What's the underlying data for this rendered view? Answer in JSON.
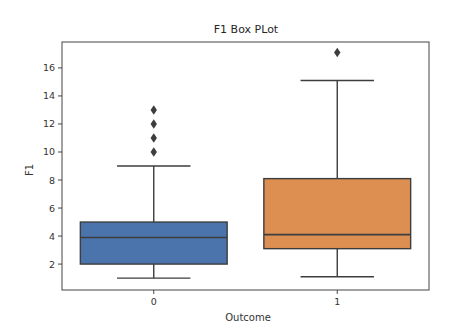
{
  "chart_data": {
    "type": "box",
    "title": "F1 Box PLot",
    "xlabel": "Outcome",
    "ylabel": "F1",
    "categories": [
      "0",
      "1"
    ],
    "ylim": [
      0.15,
      17.85
    ],
    "yticks": [
      2,
      4,
      6,
      8,
      10,
      12,
      14,
      16
    ],
    "grid": false,
    "legend": null,
    "series": [
      {
        "name": "0",
        "color": "#4a74ab",
        "whisker_low": 1,
        "q1": 2,
        "median": 3.9,
        "q3": 5,
        "whisker_high": 9,
        "outliers": [
          10,
          11,
          12,
          13
        ]
      },
      {
        "name": "1",
        "color": "#dd8f52",
        "whisker_low": 1.1,
        "q1": 3.1,
        "median": 4.1,
        "q3": 8.1,
        "whisker_high": 15.1,
        "outliers": [
          17.1
        ]
      }
    ]
  }
}
